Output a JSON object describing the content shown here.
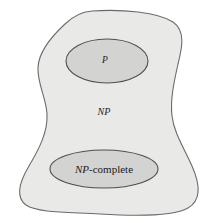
{
  "diagram": {
    "background_color": "#ffffff",
    "outer_region": {
      "name": "NP",
      "label": "NP",
      "fill_color": "#e9e9e7",
      "stroke_color": "#666666",
      "label_x": 104,
      "label_y": 113
    },
    "inner_regions": [
      {
        "name": "P",
        "label": "P",
        "fill_color": "#d3d3d1",
        "stroke_color": "#4a4a4a",
        "shape": "ellipse",
        "cx": 107,
        "cy": 61,
        "rx": 41,
        "ry": 22,
        "label_x": 105,
        "label_y": 61
      },
      {
        "name": "NP-complete",
        "label": "NP",
        "label_suffix": "-complete",
        "fill_color": "#d3d3d1",
        "stroke_color": "#4a4a4a",
        "shape": "ellipse",
        "cx": 104,
        "cy": 169,
        "rx": 54,
        "ry": 19,
        "label_x": 104,
        "label_y": 170
      }
    ]
  }
}
